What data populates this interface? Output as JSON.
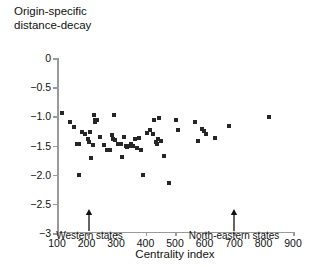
{
  "chart_data": {
    "type": "scatter",
    "title": "Origin-specific\ndistance-decay",
    "xlabel": "Centrality index",
    "ylabel": "Origin-specific distance-decay",
    "xlim": [
      100,
      900
    ],
    "ylim": [
      -3,
      0
    ],
    "xticks": [
      100,
      200,
      300,
      400,
      500,
      600,
      700,
      800,
      900
    ],
    "xticklabels": [
      "100",
      "200",
      "300",
      "400",
      "500",
      "600",
      "700",
      "800",
      "900"
    ],
    "yticks": [
      0,
      -0.5,
      -1.0,
      -1.5,
      -2.0,
      -2.5,
      -3
    ],
    "yticklabels": [
      "0",
      "−0.5",
      "−1.0",
      "−1.5",
      "−2.0",
      "−2.5",
      "−3"
    ],
    "grid": false,
    "legend": null,
    "marker": "square",
    "marker_color": "#262626",
    "points": [
      {
        "x": 118,
        "y": -0.94
      },
      {
        "x": 143,
        "y": -1.09
      },
      {
        "x": 156,
        "y": -1.18
      },
      {
        "x": 168,
        "y": -1.47
      },
      {
        "x": 173,
        "y": -1.47
      },
      {
        "x": 175,
        "y": -2.0
      },
      {
        "x": 186,
        "y": -1.27
      },
      {
        "x": 196,
        "y": -1.3
      },
      {
        "x": 205,
        "y": -1.38
      },
      {
        "x": 209,
        "y": -1.44
      },
      {
        "x": 213,
        "y": -1.27
      },
      {
        "x": 216,
        "y": -1.72
      },
      {
        "x": 221,
        "y": -1.49
      },
      {
        "x": 224,
        "y": -0.97
      },
      {
        "x": 228,
        "y": -1.06
      },
      {
        "x": 230,
        "y": -1.1
      },
      {
        "x": 236,
        "y": -1.06
      },
      {
        "x": 246,
        "y": -1.35
      },
      {
        "x": 259,
        "y": -1.49
      },
      {
        "x": 268,
        "y": -1.57
      },
      {
        "x": 281,
        "y": -1.58
      },
      {
        "x": 287,
        "y": -1.32
      },
      {
        "x": 290,
        "y": -1.38
      },
      {
        "x": 293,
        "y": -0.98
      },
      {
        "x": 296,
        "y": -1.41
      },
      {
        "x": 306,
        "y": -1.47
      },
      {
        "x": 318,
        "y": -1.48
      },
      {
        "x": 322,
        "y": -1.7
      },
      {
        "x": 328,
        "y": -1.35
      },
      {
        "x": 333,
        "y": -1.5
      },
      {
        "x": 337,
        "y": -1.52
      },
      {
        "x": 342,
        "y": -1.5
      },
      {
        "x": 347,
        "y": -1.51
      },
      {
        "x": 352,
        "y": -1.48
      },
      {
        "x": 358,
        "y": -1.5
      },
      {
        "x": 366,
        "y": -1.39
      },
      {
        "x": 372,
        "y": -1.55
      },
      {
        "x": 379,
        "y": -1.37
      },
      {
        "x": 386,
        "y": -1.58
      },
      {
        "x": 390,
        "y": -2.0
      },
      {
        "x": 404,
        "y": -1.29
      },
      {
        "x": 415,
        "y": -1.23
      },
      {
        "x": 424,
        "y": -1.31
      },
      {
        "x": 430,
        "y": -1.07
      },
      {
        "x": 436,
        "y": -1.44
      },
      {
        "x": 440,
        "y": -1.48
      },
      {
        "x": 443,
        "y": -1.38
      },
      {
        "x": 446,
        "y": -1.02
      },
      {
        "x": 452,
        "y": -1.42
      },
      {
        "x": 462,
        "y": -1.68
      },
      {
        "x": 478,
        "y": -2.15
      },
      {
        "x": 503,
        "y": -1.06
      },
      {
        "x": 510,
        "y": -1.24
      },
      {
        "x": 568,
        "y": -1.1
      },
      {
        "x": 578,
        "y": -1.42
      },
      {
        "x": 592,
        "y": -1.22
      },
      {
        "x": 598,
        "y": -1.25
      },
      {
        "x": 604,
        "y": -1.31
      },
      {
        "x": 634,
        "y": -1.37
      },
      {
        "x": 684,
        "y": -1.17
      },
      {
        "x": 820,
        "y": -1.01
      }
    ],
    "annotations": [
      {
        "label": "Western states",
        "x": 210,
        "arrow": "up"
      },
      {
        "label": "North-eastern states",
        "x": 700,
        "arrow": "up"
      }
    ]
  }
}
